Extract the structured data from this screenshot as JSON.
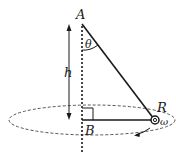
{
  "diagram": {
    "labels": {
      "point_a": "A",
      "point_b": "B",
      "point_r": "R",
      "angle": "θ",
      "height": "h",
      "angular_velocity": "ω"
    },
    "colors": {
      "stroke": "#1a1a1a",
      "dashed": "#555555",
      "background": "#ffffff"
    }
  }
}
